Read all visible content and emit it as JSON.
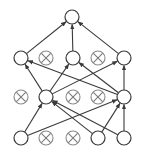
{
  "diagram": {
    "type": "neural-network-dropout",
    "node_radius": 7,
    "colors": {
      "active_stroke": "#3a3a3a",
      "dropped_stroke": "#8a8a8a",
      "dropped_x": "#7a7a7a",
      "edge": "#3a3a3a",
      "background": "#ffffff"
    },
    "nodes": [
      {
        "id": "out",
        "layer": 0,
        "x": 72,
        "y": 17,
        "dropped": false
      },
      {
        "id": "h2a",
        "layer": 1,
        "x": 21,
        "y": 58,
        "dropped": false
      },
      {
        "id": "h2b",
        "layer": 1,
        "x": 46,
        "y": 58,
        "dropped": true
      },
      {
        "id": "h2c",
        "layer": 1,
        "x": 73,
        "y": 58,
        "dropped": false
      },
      {
        "id": "h2d",
        "layer": 1,
        "x": 98,
        "y": 58,
        "dropped": true
      },
      {
        "id": "h2e",
        "layer": 1,
        "x": 124,
        "y": 58,
        "dropped": false
      },
      {
        "id": "h1a",
        "layer": 2,
        "x": 21,
        "y": 97,
        "dropped": true
      },
      {
        "id": "h1b",
        "layer": 2,
        "x": 46,
        "y": 97,
        "dropped": false
      },
      {
        "id": "h1c",
        "layer": 2,
        "x": 73,
        "y": 97,
        "dropped": true
      },
      {
        "id": "h1d",
        "layer": 2,
        "x": 98,
        "y": 97,
        "dropped": true
      },
      {
        "id": "h1e",
        "layer": 2,
        "x": 124,
        "y": 97,
        "dropped": false
      },
      {
        "id": "in1",
        "layer": 3,
        "x": 21,
        "y": 138,
        "dropped": false
      },
      {
        "id": "in2",
        "layer": 3,
        "x": 46,
        "y": 138,
        "dropped": true
      },
      {
        "id": "in3",
        "layer": 3,
        "x": 73,
        "y": 138,
        "dropped": true
      },
      {
        "id": "in4",
        "layer": 3,
        "x": 98,
        "y": 138,
        "dropped": false
      },
      {
        "id": "in5",
        "layer": 3,
        "x": 124,
        "y": 138,
        "dropped": false
      }
    ],
    "edges": [
      {
        "from": "h2a",
        "to": "out"
      },
      {
        "from": "h2c",
        "to": "out"
      },
      {
        "from": "h2e",
        "to": "out"
      },
      {
        "from": "h1b",
        "to": "h2a"
      },
      {
        "from": "h1e",
        "to": "h2a"
      },
      {
        "from": "h1b",
        "to": "h2c"
      },
      {
        "from": "h1e",
        "to": "h2c"
      },
      {
        "from": "h1b",
        "to": "h2e"
      },
      {
        "from": "h1e",
        "to": "h2e"
      },
      {
        "from": "in1",
        "to": "h1b"
      },
      {
        "from": "in4",
        "to": "h1b"
      },
      {
        "from": "in5",
        "to": "h1b"
      },
      {
        "from": "in1",
        "to": "h1e"
      },
      {
        "from": "in4",
        "to": "h1e"
      },
      {
        "from": "in5",
        "to": "h1e"
      }
    ]
  }
}
